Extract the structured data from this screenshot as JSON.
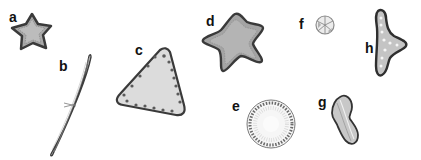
{
  "figure": {
    "panels": [
      {
        "id": "a",
        "label": "a",
        "shape": "five-pointed star (small)"
      },
      {
        "id": "b",
        "label": "b",
        "shape": "elongated lanceolate spindle"
      },
      {
        "id": "c",
        "label": "c",
        "shape": "rounded triangle with marginal chambers"
      },
      {
        "id": "d",
        "label": "d",
        "shape": "five-pointed star (large)"
      },
      {
        "id": "e",
        "label": "e",
        "shape": "circular disc with radial striae"
      },
      {
        "id": "f",
        "label": "f",
        "shape": "small circular disc with sectors"
      },
      {
        "id": "g",
        "label": "g",
        "shape": "constricted peanut-shaped valve"
      },
      {
        "id": "h",
        "label": "h",
        "shape": "tripolar / boomerang valve"
      }
    ],
    "colors": {
      "background": "#ffffff",
      "outline": "#3a3a3a",
      "fill": "#bdbdbd",
      "light_fill": "#e6e6e6",
      "label": "#111111"
    }
  }
}
